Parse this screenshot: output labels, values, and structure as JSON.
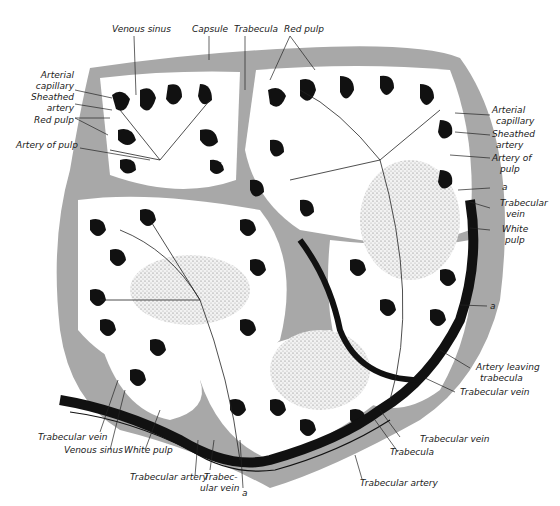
{
  "diagram": {
    "colors": {
      "capsule_trabecula": "#a8a8a8",
      "red_pulp_sinus": "#111111",
      "white_pulp_stipple": "#e6e6e6",
      "background": "#ffffff"
    },
    "labels": {
      "top": [
        {
          "text": "Venous sinus"
        },
        {
          "text": "Capsule"
        },
        {
          "text": "Trabecula"
        },
        {
          "text": "Red pulp"
        }
      ],
      "left": [
        {
          "text": "Arterial"
        },
        {
          "text": "capillary"
        },
        {
          "text": "Sheathed"
        },
        {
          "text": "artery"
        },
        {
          "text": "Red pulp"
        },
        {
          "text": "Artery of pulp"
        }
      ],
      "right": [
        {
          "text": "Arterial"
        },
        {
          "text": "capillary"
        },
        {
          "text": "Sheathed"
        },
        {
          "text": "artery"
        },
        {
          "text": "Artery of"
        },
        {
          "text": "pulp"
        },
        {
          "text": "a"
        },
        {
          "text": "Trabecular"
        },
        {
          "text": "vein"
        },
        {
          "text": "White"
        },
        {
          "text": "pulp"
        },
        {
          "text": "a"
        },
        {
          "text": "Artery leaving"
        },
        {
          "text": "trabecula"
        },
        {
          "text": "Trabecular vein"
        }
      ],
      "bottom": [
        {
          "text": "Trabecular vein"
        },
        {
          "text": "Venous sinus"
        },
        {
          "text": "White pulp"
        },
        {
          "text": "Trabecular artery"
        },
        {
          "text": "Trabec-"
        },
        {
          "text": "ular vein"
        },
        {
          "text": "a"
        },
        {
          "text": "Trabecula"
        },
        {
          "text": "Trabecular vein"
        },
        {
          "text": "Trabecular artery"
        }
      ]
    }
  }
}
